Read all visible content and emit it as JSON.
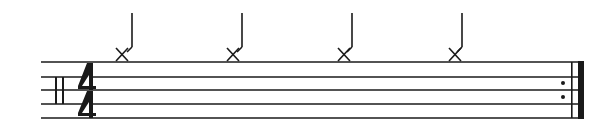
{
  "score": {
    "type": "percussion-staff",
    "clef": "percussion",
    "time_signature": {
      "numerator": "4",
      "denominator": "4"
    },
    "staff_lines": 5,
    "notes": [
      {
        "index": 1,
        "notehead": "x",
        "duration": "quarter",
        "stem": "up",
        "position": "above-staff"
      },
      {
        "index": 2,
        "notehead": "x",
        "duration": "quarter",
        "stem": "up",
        "position": "above-staff"
      },
      {
        "index": 3,
        "notehead": "x",
        "duration": "quarter",
        "stem": "up",
        "position": "above-staff"
      },
      {
        "index": 4,
        "notehead": "x",
        "duration": "quarter",
        "stem": "up",
        "position": "above-staff"
      }
    ],
    "end_barline": "repeat-end",
    "colors": {
      "ink": "#1a1a1a",
      "background": "#ffffff"
    }
  }
}
